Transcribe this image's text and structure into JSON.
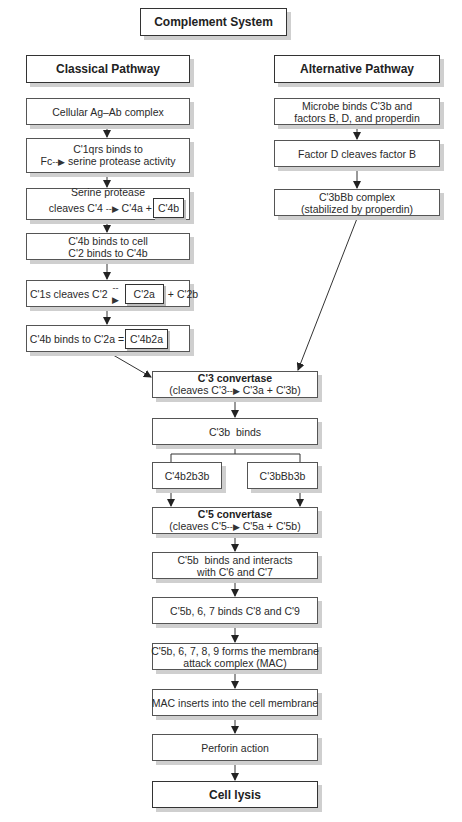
{
  "title": "Complement System",
  "classical": {
    "heading": "Classical Pathway",
    "steps": [
      {
        "lines": [
          "Cellular Ag–Ab complex"
        ]
      },
      {
        "line1": "C'1qrs binds to",
        "line2_pre": "Fc",
        "line2_post": "serine protease activity"
      },
      {
        "line1": "Serine protease",
        "line2_pre": "cleaves C'4",
        "line2_mid": "C'4a +",
        "boxed": "C'4b"
      },
      {
        "line1": "C'4b binds to cell",
        "line2": "C'2 binds to C'4b"
      },
      {
        "pre": "C'1s cleaves C'2",
        "boxed": "C'2a",
        "post": "+ C'2b"
      },
      {
        "pre": "C'4b binds to C'2a =",
        "boxed": "C'4b2a"
      }
    ]
  },
  "alternative": {
    "heading": "Alternative Pathway",
    "steps": [
      {
        "line1": "Microbe binds C'3b and",
        "line2": "factors B, D, and properdin"
      },
      {
        "line1": "Factor D cleaves factor B"
      },
      {
        "line1": "C'3bBb complex",
        "line2": "(stabilized by properdin)"
      }
    ]
  },
  "common": {
    "c3_convertase": {
      "title": "C'3 convertase",
      "pre": "(cleaves C'3",
      "post": "C'3a + C'3b)"
    },
    "c3b_binds": "C'3b  binds",
    "branch_left": "C'4b2b3b",
    "branch_right": "C'3bBb3b",
    "c5_convertase": {
      "title": "C'5 convertase",
      "pre": "(cleaves C'5",
      "post": "C'5a + C'5b)"
    },
    "c5b_binds": {
      "line1": "C'5b  binds and interacts",
      "line2": "with C'6 and C'7"
    },
    "c5b67": "C'5b, 6, 7 binds C'8 and C'9",
    "mac_forms": {
      "line1": "C'5b, 6, 7, 8, 9 forms the membrane",
      "line2": "attack complex (MAC)"
    },
    "mac_inserts": "MAC inserts into the cell membrane",
    "perforin": "Perforin action",
    "cell_lysis": "Cell lysis"
  },
  "arrow_glyph": "--▶"
}
